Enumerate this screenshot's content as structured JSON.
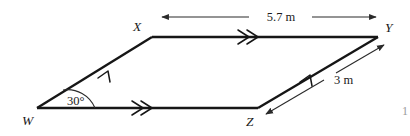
{
  "figure": {
    "background_color": "#ffffff",
    "line_color": "#161616",
    "dimension_color": "#2a2a2a",
    "text_color": "#1a1a1a"
  },
  "vertices": [
    {
      "id": "W",
      "label": "W",
      "x": 37,
      "y": 108,
      "label_x": 22,
      "label_y": 125
    },
    {
      "id": "X",
      "label": "X",
      "x": 152,
      "y": 37,
      "label_x": 137,
      "label_y": 31
    },
    {
      "id": "Y",
      "label": "Y",
      "x": 378,
      "y": 37,
      "label_x": 385,
      "label_y": 32
    },
    {
      "id": "Z",
      "label": "Z",
      "x": 258,
      "y": 108,
      "label_x": 246,
      "label_y": 126
    }
  ],
  "edges": [
    {
      "id": "WX",
      "from": "W",
      "to": "X",
      "tick_marks": 1
    },
    {
      "id": "XY",
      "from": "X",
      "to": "Y",
      "tick_marks": 2
    },
    {
      "id": "ZY",
      "from": "Z",
      "to": "Y",
      "tick_marks": 1
    },
    {
      "id": "WZ",
      "from": "W",
      "to": "Z",
      "tick_marks": 2
    }
  ],
  "dimensions": [
    {
      "id": "top-dimension",
      "label": "5.7 m",
      "value": 5.7,
      "unit": "m",
      "measures_edge": "XY",
      "label_x": 281,
      "label_y": 21,
      "orientation": "horizontal",
      "arrowheads": "both"
    },
    {
      "id": "right-dimension",
      "label": "3 m",
      "value": 3,
      "unit": "m",
      "measures_edge": "ZY",
      "label_x": 334,
      "label_y": 84,
      "orientation": "diagonal",
      "arrowheads": "both"
    }
  ],
  "angles": [
    {
      "id": "angle-w",
      "label": "30°",
      "value": 30,
      "unit": "degrees",
      "at_vertex": "W",
      "label_x": 67,
      "label_y": 105
    }
  ],
  "margin_text": {
    "right_edge_fragment": "1"
  }
}
